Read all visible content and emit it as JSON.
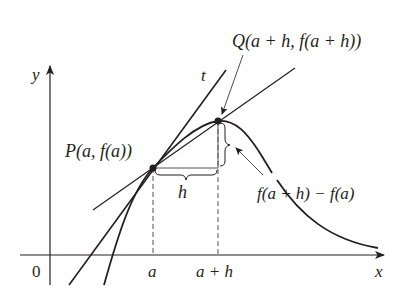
{
  "figure": {
    "type": "derivative-secant-tangent-diagram",
    "colors": {
      "ink": "#231f20",
      "dash": "#555555",
      "background": "#ffffff"
    }
  },
  "axes": {
    "y_label": "y",
    "x_label": "x",
    "origin_label": "0"
  },
  "ticks": {
    "a": "a",
    "a_plus_h": "a + h"
  },
  "points": {
    "P": {
      "name": "P",
      "label": "P(a, f(a))"
    },
    "Q": {
      "name": "Q",
      "label": "Q(a + h, f(a + h))"
    }
  },
  "lines": {
    "tangent_label": "t"
  },
  "annotations": {
    "h_label": "h",
    "rise_label": "f(a + h) − f(a)"
  }
}
